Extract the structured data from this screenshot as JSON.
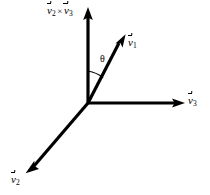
{
  "figure": {
    "background_color": "#ffffff",
    "stroke_color": "#000000",
    "width": 210,
    "height": 195
  },
  "labels": {
    "cross_product": {
      "v_symbol": "v",
      "sub_a": "2",
      "cross": "×",
      "sub_b": "3",
      "text": "v⃗2 × v⃗3"
    },
    "v1": {
      "v_symbol": "v",
      "sub": "1",
      "text": "v⃗1"
    },
    "v2": {
      "v_symbol": "v",
      "sub": "2",
      "text": "v⃗2"
    },
    "v3": {
      "v_symbol": "v",
      "sub": "3",
      "text": "v⃗3"
    },
    "theta": "θ"
  },
  "geometry": {
    "origin": {
      "x": 88,
      "y": 103
    },
    "vectors": [
      {
        "name": "v2-cross-v3-axis",
        "tip": {
          "x": 88,
          "y": 9
        },
        "label": "v⃗2 × v⃗3"
      },
      {
        "name": "v1",
        "tip": {
          "x": 126,
          "y": 35
        },
        "label": "v⃗1"
      },
      {
        "name": "v3",
        "tip": {
          "x": 184,
          "y": 103
        },
        "label": "v⃗3"
      },
      {
        "name": "v2",
        "tip": {
          "x": 26,
          "y": 173
        },
        "label": "v⃗2"
      }
    ],
    "angle_arc": {
      "between": [
        "v2-cross-v3-axis",
        "v1"
      ],
      "radius": 32,
      "label": "θ"
    }
  }
}
